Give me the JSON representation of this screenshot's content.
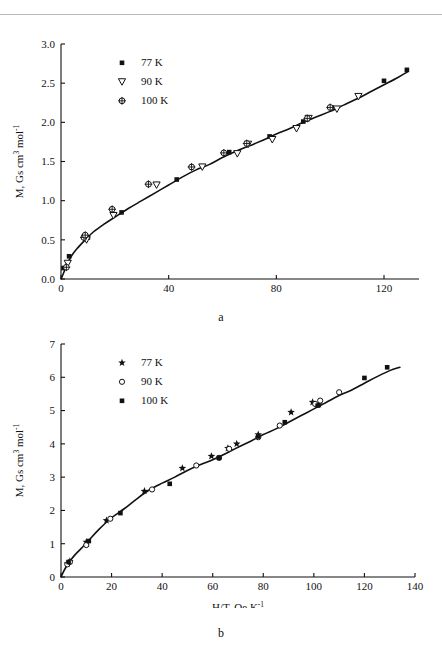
{
  "figure": {
    "panel_a_letter": "a",
    "panel_b_letter": "b"
  },
  "chart_data": [
    {
      "id": "panel-a",
      "type": "scatter",
      "title": "",
      "panel_label": "a",
      "xlabel": "H/T, Oe K",
      "xlabel_sup": "-1",
      "ylabel": "M, Gs cm",
      "ylabel_sup1": "3",
      "ylabel_mid": " mol",
      "ylabel_sup2": "-1",
      "xlim": [
        0,
        133
      ],
      "ylim": [
        0,
        3.0
      ],
      "xticks": [
        0,
        40,
        80,
        120
      ],
      "xtick_labels": [
        "0",
        "40",
        "80",
        "120"
      ],
      "yticks": [
        0.0,
        0.5,
        1.0,
        1.5,
        2.0,
        2.5,
        3.0
      ],
      "ytick_labels": [
        "0.0",
        "0.5",
        "1.0",
        "1.5",
        "2.0",
        "2.5",
        "3.0"
      ],
      "grid": false,
      "legend_position": "upper-left",
      "series": [
        {
          "name": "77 K",
          "marker": "filled-square",
          "points": [
            [
              0.9,
              0.14
            ],
            [
              3.0,
              0.29
            ],
            [
              10.0,
              0.53
            ],
            [
              22.5,
              0.85
            ],
            [
              43.0,
              1.27
            ],
            [
              62.5,
              1.62
            ],
            [
              77.5,
              1.82
            ],
            [
              90.0,
              2.01
            ],
            [
              100.5,
              2.19
            ],
            [
              120.0,
              2.53
            ],
            [
              128.5,
              2.67
            ]
          ]
        },
        {
          "name": "90 K",
          "marker": "open-triangle-down",
          "points": [
            [
              2.5,
              0.2
            ],
            [
              9.5,
              0.5
            ],
            [
              19.5,
              0.81
            ],
            [
              35.5,
              1.2
            ],
            [
              52.5,
              1.43
            ],
            [
              65.5,
              1.6
            ],
            [
              69.5,
              1.72
            ],
            [
              78.5,
              1.78
            ],
            [
              87.5,
              1.92
            ],
            [
              92.0,
              2.05
            ],
            [
              102.5,
              2.17
            ],
            [
              110.5,
              2.33
            ]
          ]
        },
        {
          "name": "100 K",
          "marker": "circle-plus",
          "points": [
            [
              2.0,
              0.15
            ],
            [
              8.5,
              0.53
            ],
            [
              9.0,
              0.56
            ],
            [
              19.0,
              0.89
            ],
            [
              32.5,
              1.21
            ],
            [
              48.5,
              1.43
            ],
            [
              60.5,
              1.61
            ],
            [
              69.0,
              1.73
            ],
            [
              91.5,
              2.05
            ],
            [
              100.0,
              2.19
            ]
          ]
        }
      ],
      "fit_curve": {
        "description": "Langevin-like saturating fit through all series",
        "points": [
          [
            0,
            0.0
          ],
          [
            1,
            0.08
          ],
          [
            2,
            0.17
          ],
          [
            4,
            0.3
          ],
          [
            6,
            0.39
          ],
          [
            9,
            0.5
          ],
          [
            12,
            0.6
          ],
          [
            16,
            0.7
          ],
          [
            20,
            0.79
          ],
          [
            25,
            0.9
          ],
          [
            30,
            1.0
          ],
          [
            35,
            1.1
          ],
          [
            40,
            1.2
          ],
          [
            45,
            1.3
          ],
          [
            50,
            1.39
          ],
          [
            55,
            1.46
          ],
          [
            60,
            1.55
          ],
          [
            65,
            1.63
          ],
          [
            70,
            1.7
          ],
          [
            75,
            1.77
          ],
          [
            80,
            1.85
          ],
          [
            85,
            1.92
          ],
          [
            90,
            2.0
          ],
          [
            95,
            2.07
          ],
          [
            100,
            2.14
          ],
          [
            105,
            2.22
          ],
          [
            110,
            2.3
          ],
          [
            115,
            2.39
          ],
          [
            120,
            2.48
          ],
          [
            125,
            2.57
          ],
          [
            129,
            2.65
          ]
        ]
      }
    },
    {
      "id": "panel-b",
      "type": "scatter",
      "title": "",
      "panel_label": "b",
      "xlabel": "H/T, Oe K",
      "xlabel_sup": "-1",
      "ylabel": "M, Gs cm",
      "ylabel_sup1": "3",
      "ylabel_mid": " mol",
      "ylabel_sup2": "-1",
      "xlim": [
        0,
        140
      ],
      "ylim": [
        0,
        7
      ],
      "xticks": [
        0,
        20,
        40,
        60,
        80,
        100,
        120,
        140
      ],
      "xtick_labels": [
        "0",
        "20",
        "40",
        "60",
        "80",
        "100",
        "120",
        "140"
      ],
      "yticks": [
        0,
        1,
        2,
        3,
        4,
        5,
        6,
        7
      ],
      "ytick_labels": [
        "0",
        "1",
        "2",
        "3",
        "4",
        "5",
        "6",
        "7"
      ],
      "grid": false,
      "legend_position": "upper-left",
      "series": [
        {
          "name": "77 K",
          "marker": "star",
          "points": [
            [
              2.5,
              0.4
            ],
            [
              3.5,
              0.47
            ],
            [
              10.0,
              1.05
            ],
            [
              18.0,
              1.7
            ],
            [
              33.0,
              2.58
            ],
            [
              48.0,
              3.27
            ],
            [
              59.5,
              3.63
            ],
            [
              66.0,
              3.87
            ],
            [
              69.5,
              4.0
            ],
            [
              78.0,
              4.28
            ],
            [
              91.0,
              4.95
            ],
            [
              99.5,
              5.25
            ],
            [
              102.0,
              5.18
            ]
          ]
        },
        {
          "name": "90 K",
          "marker": "open-circle",
          "points": [
            [
              2.5,
              0.38
            ],
            [
              3.5,
              0.45
            ],
            [
              10.0,
              0.96
            ],
            [
              19.5,
              1.75
            ],
            [
              36.0,
              2.63
            ],
            [
              53.5,
              3.35
            ],
            [
              62.5,
              3.58
            ],
            [
              66.5,
              3.85
            ],
            [
              78.0,
              4.2
            ],
            [
              86.5,
              4.55
            ],
            [
              100.5,
              5.2
            ],
            [
              102.5,
              5.3
            ],
            [
              110.0,
              5.55
            ]
          ]
        },
        {
          "name": "100 K",
          "marker": "filled-square",
          "points": [
            [
              3.0,
              0.45
            ],
            [
              11.0,
              1.08
            ],
            [
              23.5,
              1.92
            ],
            [
              43.0,
              2.8
            ],
            [
              62.5,
              3.58
            ],
            [
              78.0,
              4.22
            ],
            [
              88.5,
              4.65
            ],
            [
              101.5,
              5.15
            ],
            [
              120.0,
              5.98
            ],
            [
              129.0,
              6.3
            ]
          ]
        }
      ],
      "fit_curve": {
        "description": "Langevin-like saturating fit through all series",
        "points": [
          [
            0,
            0.0
          ],
          [
            1,
            0.16
          ],
          [
            2,
            0.3
          ],
          [
            3,
            0.42
          ],
          [
            5,
            0.62
          ],
          [
            8,
            0.86
          ],
          [
            11,
            1.1
          ],
          [
            15,
            1.43
          ],
          [
            20,
            1.78
          ],
          [
            25,
            2.05
          ],
          [
            30,
            2.35
          ],
          [
            35,
            2.62
          ],
          [
            40,
            2.82
          ],
          [
            45,
            3.0
          ],
          [
            50,
            3.2
          ],
          [
            55,
            3.37
          ],
          [
            60,
            3.52
          ],
          [
            65,
            3.7
          ],
          [
            70,
            3.9
          ],
          [
            75,
            4.08
          ],
          [
            80,
            4.28
          ],
          [
            85,
            4.45
          ],
          [
            90,
            4.65
          ],
          [
            95,
            4.85
          ],
          [
            100,
            5.05
          ],
          [
            105,
            5.25
          ],
          [
            110,
            5.45
          ],
          [
            115,
            5.62
          ],
          [
            120,
            5.82
          ],
          [
            125,
            6.02
          ],
          [
            130,
            6.2
          ],
          [
            134,
            6.3
          ]
        ]
      }
    }
  ]
}
